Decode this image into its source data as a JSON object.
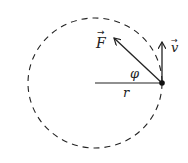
{
  "diagram": {
    "circle": {
      "style": "dashed",
      "cx": 95,
      "cy": 83,
      "rx": 67,
      "ry": 65
    },
    "point": {
      "x": 162,
      "y": 83
    },
    "labels": {
      "force": "F",
      "velocity": "v",
      "angle": "φ",
      "radius": "r"
    },
    "vectors": [
      {
        "name": "F",
        "from": [
          162,
          83
        ],
        "to": [
          114,
          38
        ],
        "arrow": "→",
        "description": "force vector"
      },
      {
        "name": "v",
        "from": [
          162,
          83
        ],
        "to": [
          162,
          42
        ],
        "arrow": "→",
        "description": "velocity vector"
      }
    ],
    "segments": [
      {
        "name": "r",
        "from": [
          95,
          83
        ],
        "to": [
          162,
          83
        ],
        "description": "radius"
      }
    ],
    "colors": {
      "stroke": "#222222",
      "background": "#ffffff"
    }
  }
}
